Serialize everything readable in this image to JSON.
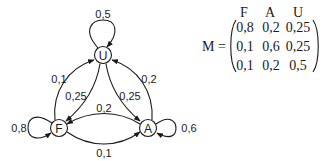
{
  "graph": {
    "nodes": [
      {
        "id": "U",
        "label": "U"
      },
      {
        "id": "F",
        "label": "F"
      },
      {
        "id": "A",
        "label": "A"
      }
    ],
    "edges": [
      {
        "from": "U",
        "to": "U",
        "label": "0,5"
      },
      {
        "from": "F",
        "to": "F",
        "label": "0,8"
      },
      {
        "from": "A",
        "to": "A",
        "label": "0,6"
      },
      {
        "from": "F",
        "to": "U",
        "label": "0,1"
      },
      {
        "from": "U",
        "to": "F",
        "label": "0,25"
      },
      {
        "from": "U",
        "to": "A",
        "label": "0,25"
      },
      {
        "from": "A",
        "to": "U",
        "label": "0,2"
      },
      {
        "from": "A",
        "to": "F",
        "label": "0,2"
      },
      {
        "from": "F",
        "to": "A",
        "label": "0,1"
      }
    ]
  },
  "matrix": {
    "name": "M =",
    "col_headers": [
      "F",
      "A",
      "U"
    ],
    "rows": [
      [
        "0,8",
        "0,2",
        "0,25"
      ],
      [
        "0,1",
        "0,6",
        "0,25"
      ],
      [
        "0,1",
        "0,2",
        "0,5"
      ]
    ]
  }
}
